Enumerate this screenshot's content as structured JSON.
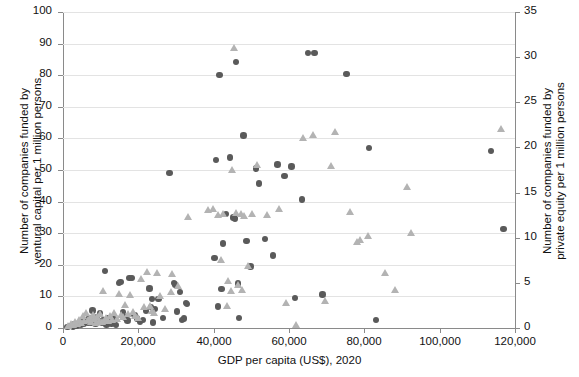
{
  "chart_data": {
    "type": "scatter",
    "title": "",
    "xlabel": "GDP per capita (US$), 2020",
    "ylabel": "Number of companies funded by ventural capital per 1 million persons",
    "y2label": "Number of companies funded by private equity per 1 million persons",
    "xlim": [
      0,
      120000
    ],
    "ylim": [
      0,
      100
    ],
    "y2lim": [
      0,
      35
    ],
    "xticks": [
      "0",
      "20,000",
      "40,000",
      "60,000",
      "80,000",
      "100,000",
      "120,000"
    ],
    "xtick_values": [
      0,
      20000,
      40000,
      60000,
      80000,
      100000,
      120000
    ],
    "yticks": [
      "0",
      "10",
      "20",
      "30",
      "40",
      "50",
      "60",
      "70",
      "80",
      "90",
      "100"
    ],
    "ytick_values": [
      0,
      10,
      20,
      30,
      40,
      50,
      60,
      70,
      80,
      90,
      100
    ],
    "y2ticks": [
      "0",
      "5",
      "10",
      "15",
      "20",
      "25",
      "30",
      "35"
    ],
    "y2tick_values": [
      0,
      5,
      10,
      15,
      20,
      25,
      30,
      35
    ],
    "grid": "horizontal",
    "legend": "none",
    "series": [
      {
        "name": "Venture capital",
        "marker": "circle",
        "color": "#5a5a5a",
        "axis": "left",
        "points": [
          [
            1200,
            0.4
          ],
          [
            2000,
            0.6
          ],
          [
            2600,
            0.5
          ],
          [
            3100,
            1.1
          ],
          [
            3600,
            0.8
          ],
          [
            4200,
            1.4
          ],
          [
            4700,
            1.0
          ],
          [
            5200,
            2.0
          ],
          [
            5600,
            1.3
          ],
          [
            6100,
            2.6
          ],
          [
            6600,
            1.8
          ],
          [
            7000,
            3.0
          ],
          [
            7400,
            1.5
          ],
          [
            7800,
            5.5
          ],
          [
            8200,
            2.2
          ],
          [
            8600,
            1.2
          ],
          [
            9000,
            3.4
          ],
          [
            9400,
            2.0
          ],
          [
            9900,
            4.8
          ],
          [
            10300,
            1.6
          ],
          [
            10700,
            2.4
          ],
          [
            11100,
            18.1
          ],
          [
            11500,
            1.1
          ],
          [
            11900,
            3.2
          ],
          [
            12300,
            2.0
          ],
          [
            12900,
            1.4
          ],
          [
            13400,
            2.8
          ],
          [
            14100,
            1.0
          ],
          [
            14800,
            14.2
          ],
          [
            15300,
            14.5
          ],
          [
            15900,
            5.1
          ],
          [
            16400,
            3.3
          ],
          [
            17100,
            2.4
          ],
          [
            17700,
            15.9
          ],
          [
            18400,
            15.9
          ],
          [
            19000,
            4.2
          ],
          [
            19600,
            3.0
          ],
          [
            20400,
            1.9
          ],
          [
            21200,
            2.6
          ],
          [
            22100,
            5.4
          ],
          [
            23000,
            12.5
          ],
          [
            23300,
            6.6
          ],
          [
            23600,
            9.2
          ],
          [
            23900,
            1.8
          ],
          [
            24500,
            6.0
          ],
          [
            25400,
            9.2
          ],
          [
            26500,
            3.2
          ],
          [
            28300,
            49.0
          ],
          [
            29400,
            14.2
          ],
          [
            29700,
            13.8
          ],
          [
            30300,
            5.2
          ],
          [
            31000,
            11.4
          ],
          [
            31600,
            2.6
          ],
          [
            32200,
            3.0
          ],
          [
            32600,
            8.0
          ],
          [
            32900,
            7.6
          ],
          [
            40200,
            22.2
          ],
          [
            40600,
            53.1
          ],
          [
            41100,
            6.8
          ],
          [
            41600,
            80.1
          ],
          [
            42100,
            12.4
          ],
          [
            42400,
            26.7
          ],
          [
            43200,
            36.0
          ],
          [
            44400,
            53.9
          ],
          [
            45300,
            35.0
          ],
          [
            45700,
            34.7
          ],
          [
            46000,
            84.2
          ],
          [
            46400,
            14.1
          ],
          [
            46800,
            3.1
          ],
          [
            47900,
            60.9
          ],
          [
            48700,
            27.5
          ],
          [
            49800,
            19.5
          ],
          [
            51200,
            50.5
          ],
          [
            52100,
            45.7
          ],
          [
            53600,
            28.1
          ],
          [
            55800,
            23.0
          ],
          [
            56900,
            51.8
          ],
          [
            58800,
            48.1
          ],
          [
            60700,
            51.1
          ],
          [
            61600,
            9.4
          ],
          [
            63400,
            40.7
          ],
          [
            65100,
            87.0
          ],
          [
            66800,
            87.0
          ],
          [
            68900,
            10.6
          ],
          [
            75300,
            80.4
          ],
          [
            81200,
            57.0
          ],
          [
            83100,
            2.6
          ],
          [
            113600,
            56.0
          ],
          [
            116900,
            31.4
          ]
        ]
      },
      {
        "name": "Private equity",
        "marker": "triangle",
        "color": "#b3b3b3",
        "axis": "right",
        "points": [
          [
            1400,
            0.1
          ],
          [
            2200,
            0.3
          ],
          [
            2900,
            0.2
          ],
          [
            3400,
            0.5
          ],
          [
            3900,
            0.3
          ],
          [
            4400,
            0.8
          ],
          [
            4900,
            0.4
          ],
          [
            5400,
            1.2
          ],
          [
            5800,
            0.6
          ],
          [
            6300,
            1.5
          ],
          [
            6800,
            0.7
          ],
          [
            7200,
            1.0
          ],
          [
            7600,
            0.5
          ],
          [
            8000,
            1.3
          ],
          [
            8400,
            0.9
          ],
          [
            8800,
            0.4
          ],
          [
            9200,
            1.1
          ],
          [
            9600,
            0.6
          ],
          [
            10100,
            1.4
          ],
          [
            10500,
            0.5
          ],
          [
            10900,
            4.0
          ],
          [
            11300,
            0.8
          ],
          [
            11700,
            1.0
          ],
          [
            12100,
            0.6
          ],
          [
            12600,
            1.2
          ],
          [
            13100,
            0.7
          ],
          [
            13700,
            1.5
          ],
          [
            14400,
            0.9
          ],
          [
            15000,
            3.6
          ],
          [
            15600,
            1.3
          ],
          [
            16100,
            1.1
          ],
          [
            16700,
            2.4
          ],
          [
            17400,
            1.4
          ],
          [
            18000,
            3.5
          ],
          [
            18700,
            1.6
          ],
          [
            19300,
            1.2
          ],
          [
            20000,
            1.0
          ],
          [
            20800,
            5.3
          ],
          [
            21600,
            2.2
          ],
          [
            22500,
            6.1
          ],
          [
            23200,
            2.3
          ],
          [
            23700,
            1.8
          ],
          [
            24400,
            1.5
          ],
          [
            25100,
            6.0
          ],
          [
            26000,
            3.4
          ],
          [
            27200,
            2.0
          ],
          [
            28800,
            3.8
          ],
          [
            29200,
            5.9
          ],
          [
            30800,
            4.5
          ],
          [
            33400,
            12.2
          ],
          [
            38600,
            12.9
          ],
          [
            40000,
            13.0
          ],
          [
            41400,
            12.4
          ],
          [
            42000,
            7.4
          ],
          [
            42700,
            12.5
          ],
          [
            43600,
            2.3
          ],
          [
            44000,
            5.1
          ],
          [
            44800,
            4.0
          ],
          [
            45000,
            17.4
          ],
          [
            45500,
            30.9
          ],
          [
            46200,
            12.6
          ],
          [
            46600,
            4.6
          ],
          [
            47300,
            12.5
          ],
          [
            47600,
            4.1
          ],
          [
            48200,
            12.3
          ],
          [
            49200,
            6.7
          ],
          [
            50400,
            12.5
          ],
          [
            51700,
            17.9
          ],
          [
            54200,
            12.4
          ],
          [
            57600,
            13.0
          ],
          [
            59400,
            2.6
          ],
          [
            61900,
            0.2
          ],
          [
            63800,
            20.9
          ],
          [
            66500,
            21.2
          ],
          [
            69700,
            2.9
          ],
          [
            71200,
            17.8
          ],
          [
            72500,
            21.6
          ],
          [
            76300,
            12.7
          ],
          [
            78100,
            9.4
          ],
          [
            78900,
            9.6
          ],
          [
            81200,
            10.1
          ],
          [
            85600,
            6.0
          ],
          [
            88400,
            4.1
          ],
          [
            91500,
            15.5
          ],
          [
            92600,
            10.4
          ],
          [
            116500,
            21.9
          ]
        ]
      }
    ]
  },
  "axes": {
    "x_title": "GDP per capita (US$), 2020",
    "y_left_line1": "Number of companies funded by",
    "y_left_line2": "ventural capital per 1 million persons",
    "y_right_line1": "Number of companies funded by",
    "y_right_line2": "private equity per 1 million persons"
  },
  "colors": {
    "circle": "#5a5a5a",
    "triangle": "#b3b3b3",
    "grid": "#e3e3e3",
    "axis": "#8a8a8a",
    "text": "#111111",
    "background": "#ffffff"
  }
}
